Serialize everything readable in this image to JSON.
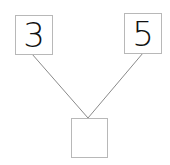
{
  "diagram": {
    "type": "number-bond",
    "parts": [
      {
        "label": "3"
      },
      {
        "label": "5"
      }
    ],
    "whole": {
      "label": ""
    },
    "colors": {
      "border": "#b8b8b8",
      "line": "#8a8a8a",
      "text": "#111111"
    }
  }
}
